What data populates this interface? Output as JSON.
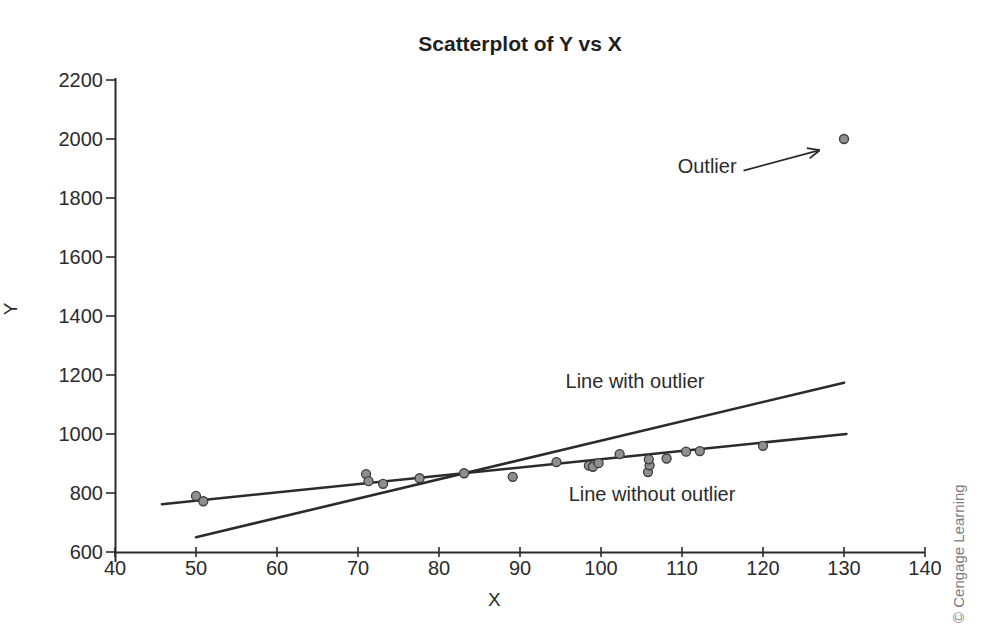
{
  "chart_data": {
    "type": "scatter",
    "title": "Scatterplot of Y vs X",
    "xlabel": "X",
    "ylabel": "Y",
    "xlim": [
      40,
      140
    ],
    "ylim": [
      600,
      2200
    ],
    "x_ticks": [
      40,
      50,
      60,
      70,
      80,
      90,
      100,
      110,
      120,
      130,
      140
    ],
    "y_ticks": [
      600,
      800,
      1000,
      1200,
      1400,
      1600,
      1800,
      2000,
      2200
    ],
    "grid": false,
    "legend": "none",
    "points": [
      [
        50,
        790
      ],
      [
        50.9,
        772
      ],
      [
        71,
        864
      ],
      [
        71.3,
        840
      ],
      [
        73.1,
        831
      ],
      [
        77.6,
        850
      ],
      [
        83.1,
        867
      ],
      [
        89.1,
        855
      ],
      [
        94.5,
        905
      ],
      [
        98.5,
        893
      ],
      [
        99,
        889
      ],
      [
        99.7,
        901
      ],
      [
        102.3,
        932
      ],
      [
        105.8,
        871
      ],
      [
        106,
        894
      ],
      [
        105.9,
        914
      ],
      [
        108.1,
        917
      ],
      [
        110.5,
        940
      ],
      [
        112.2,
        942
      ],
      [
        120,
        960
      ],
      [
        130,
        2000
      ]
    ],
    "outlier_point": [
      130,
      2000
    ],
    "lines": [
      {
        "name": "Line with outlier",
        "x1": 50,
        "y1": 650,
        "x2": 130,
        "y2": 1174
      },
      {
        "name": "Line without outlier",
        "x1": 45.8,
        "y1": 762,
        "x2": 130.3,
        "y2": 1000
      }
    ],
    "annotations": [
      {
        "text": "Outlier",
        "x": 113.1,
        "y": 1908
      },
      {
        "text": "Line with outlier",
        "x": 104.2,
        "y": 1180
      },
      {
        "text": "Line without outlier",
        "x": 106.3,
        "y": 797
      }
    ],
    "arrow": {
      "x1": 117.6,
      "y1": 1893,
      "x2": 127.0,
      "y2": 1962
    },
    "colors": {
      "axis": "#2b2b2b",
      "line": "#2b2b2b",
      "point_fill": "#8f8f8f",
      "point_stroke": "#3c3c3c",
      "text": "#2b2b2b",
      "copyright": "#7d7d7d",
      "background": "#ffffff"
    }
  },
  "footer": {
    "copyright": "© Cengage Learning"
  }
}
